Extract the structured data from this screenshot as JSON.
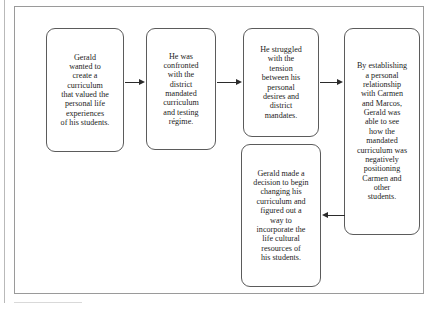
{
  "figure": {
    "type": "flowchart",
    "orientation": "left-to-right with one return branch",
    "nodes": [
      {
        "id": "node-1",
        "label": "Gerald wanted to create a curriculum that valued the personal life experiences of his students.",
        "text": "Gerald\nwanted to\ncreate a\ncurriculum\nthat valued the\npersonal life\nexperiences\nof his students."
      },
      {
        "id": "node-2",
        "label": "He was confronted with the district mandated curriculum and testing regime.",
        "text": "He was\nconfronted\nwith the\ndistrict\nmandated\ncurriculum\nand testing\nrégime."
      },
      {
        "id": "node-3",
        "label": "He struggled with the tension between his personal desires and district mandates.",
        "text": "He struggled\nwith the\ntension\nbetween his\npersonal\ndesires and\ndistrict\nmandates."
      },
      {
        "id": "node-4",
        "label": "By establishing a personal relationship with Carmen and Marcos, Gerald was able to see how the mandated curriculum was negatively positioning Carmen and other students.",
        "text": "By establishing\na personal\nrelationship\nwith Carmen\nand Marcos,\nGerald was\nable to see\nhow the\nmandated\ncurriculum was\nnegatively\npositioning\nCarmen and\nother\nstudents."
      },
      {
        "id": "node-5",
        "label": "Gerald made a decision to begin changing his curriculum and figured out a way to incorporate the life cultural resources of his students.",
        "text": "Gerald made a\ndecision to begin\nchanging his\ncurriculum and\nfigured out a\nway to\nincorporate the\nlife cultural\nresources of\nhis students."
      }
    ],
    "connectors": [
      {
        "id": "arrow-1",
        "from": "node-1",
        "to": "node-2",
        "direction": "right"
      },
      {
        "id": "arrow-2",
        "from": "node-2",
        "to": "node-3",
        "direction": "right"
      },
      {
        "id": "arrow-3",
        "from": "node-3",
        "to": "node-4",
        "direction": "right"
      },
      {
        "id": "arrow-4",
        "from": "node-4",
        "to": "node-5",
        "direction": "left"
      }
    ]
  },
  "colors": {
    "node_border": "#5b5b5b",
    "frame_border": "#9a9a9a",
    "connector": "#2b2b2b",
    "text": "#1c1c1c",
    "background": "#ffffff"
  }
}
